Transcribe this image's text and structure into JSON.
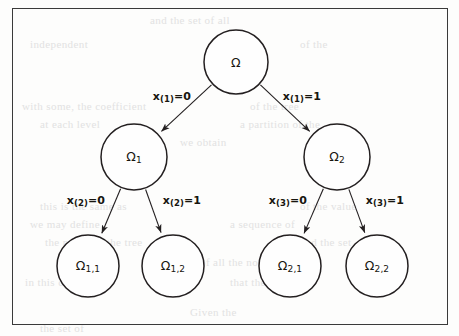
{
  "diagram": {
    "type": "binary-tree",
    "title_text": "",
    "colors": {
      "stroke": "#231f20",
      "frame": "#3a3a3a",
      "background": "#fdfdfc",
      "text": "#17150f"
    },
    "frame": {
      "x": 12,
      "y": 8,
      "width": 436,
      "height": 317
    },
    "nodes": [
      {
        "id": "root",
        "base": "Ω",
        "sub": "",
        "cx": 236,
        "cy": 62,
        "r": 32,
        "level": 0
      },
      {
        "id": "n1",
        "base": "Ω",
        "sub": "1",
        "cx": 134,
        "cy": 157,
        "r": 33,
        "level": 1
      },
      {
        "id": "n2",
        "base": "Ω",
        "sub": "2",
        "cx": 337,
        "cy": 157,
        "r": 33,
        "level": 1
      },
      {
        "id": "n11",
        "base": "Ω",
        "sub": "1,1",
        "cx": 88,
        "cy": 266,
        "r": 31,
        "level": 2
      },
      {
        "id": "n12",
        "base": "Ω",
        "sub": "1,2",
        "cx": 173,
        "cy": 266,
        "r": 31,
        "level": 2
      },
      {
        "id": "n21",
        "base": "Ω",
        "sub": "2,1",
        "cx": 290,
        "cy": 266,
        "r": 31,
        "level": 2
      },
      {
        "id": "n22",
        "base": "Ω",
        "sub": "2,2",
        "cx": 377,
        "cy": 266,
        "r": 31,
        "level": 2
      }
    ],
    "edges": [
      {
        "id": "e-root-n1",
        "from": "root",
        "to": "n1",
        "label_base": "x",
        "label_sub": "(1)",
        "label_rest": "=0",
        "label_x": 172,
        "label_y": 97
      },
      {
        "id": "e-root-n2",
        "from": "root",
        "to": "n2",
        "label_base": "x",
        "label_sub": "(1)",
        "label_rest": "=1",
        "label_x": 302,
        "label_y": 97
      },
      {
        "id": "e-n1-n11",
        "from": "n1",
        "to": "n11",
        "label_base": "x",
        "label_sub": "(2)",
        "label_rest": "=0",
        "label_x": 86,
        "label_y": 201
      },
      {
        "id": "e-n1-n12",
        "from": "n1",
        "to": "n12",
        "label_base": "x",
        "label_sub": "(2)",
        "label_rest": "=1",
        "label_x": 182,
        "label_y": 201
      },
      {
        "id": "e-n2-n21",
        "from": "n2",
        "to": "n21",
        "label_base": "x",
        "label_sub": "(3)",
        "label_rest": "=0",
        "label_x": 288,
        "label_y": 201
      },
      {
        "id": "e-n2-n22",
        "from": "n2",
        "to": "n22",
        "label_base": "x",
        "label_sub": "(3)",
        "label_rest": "=1",
        "label_x": 385,
        "label_y": 201
      }
    ],
    "bleed_lines": [
      {
        "text": "and the set of all",
        "x": 150,
        "y": 14
      },
      {
        "text": "independent",
        "x": 30,
        "y": 38
      },
      {
        "text": "of the",
        "x": 300,
        "y": 38
      },
      {
        "text": "with some, the coefficient",
        "x": 22,
        "y": 100
      },
      {
        "text": "of the tree",
        "x": 250,
        "y": 100
      },
      {
        "text": "at each level",
        "x": 40,
        "y": 118
      },
      {
        "text": "a partition of the",
        "x": 240,
        "y": 118
      },
      {
        "text": "we obtain",
        "x": 180,
        "y": 136
      },
      {
        "text": "this is the same as",
        "x": 40,
        "y": 200
      },
      {
        "text": "of the value",
        "x": 300,
        "y": 200
      },
      {
        "text": "we may define",
        "x": 30,
        "y": 218
      },
      {
        "text": "a sequence of",
        "x": 230,
        "y": 218
      },
      {
        "text": "the nodes of the tree",
        "x": 45,
        "y": 236
      },
      {
        "text": "and the set",
        "x": 300,
        "y": 236
      },
      {
        "text": "of all the nodes",
        "x": 200,
        "y": 256
      },
      {
        "text": "in this case",
        "x": 25,
        "y": 276
      },
      {
        "text": "that the tree is",
        "x": 230,
        "y": 276
      },
      {
        "text": "Given the",
        "x": 190,
        "y": 306
      },
      {
        "text": "the set of",
        "x": 40,
        "y": 322
      }
    ]
  }
}
